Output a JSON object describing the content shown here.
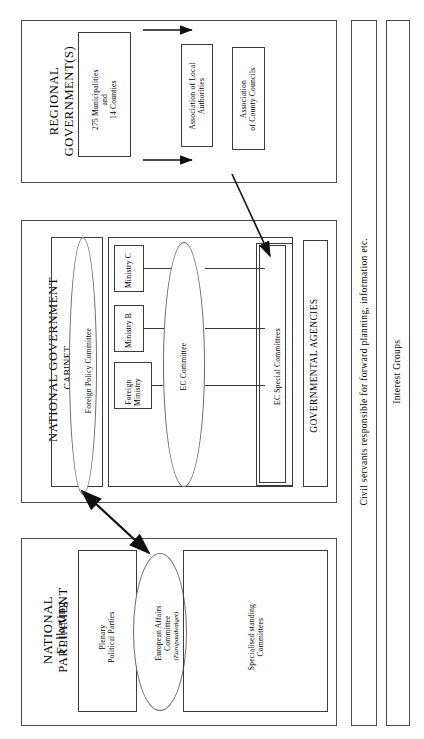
{
  "figure": {
    "orientation": "rotated-90-ccw",
    "panels": {
      "regional": {
        "title": "REGIONAL\nGOVERNMENT(S)",
        "boxes": {
          "municipalities": "275 Municipalities\nand\n14 Counties",
          "association_local": "Association of Local\nAuthorities",
          "association_county": "Association\nof County Councils"
        }
      },
      "national_government": {
        "title": "NATIONAL GOVERNMENT",
        "cabinet_label": "CABINET",
        "foreign_policy_committee": "Foreign Policy Committee",
        "ministries": [
          "Ministry C",
          "Ministry B",
          "Foreign\nMinistry"
        ],
        "ec_committee": "EC Committee",
        "ec_special_committees": "EC Special Committees",
        "governmental_agencies": "GOVERNMENTAL AGENCIES"
      },
      "national_parliament": {
        "title": "NATIONAL\nPARLIAMENT",
        "subtitle": "Folketing",
        "plenary": "Plenary\nPolitical Parties",
        "european_affairs_committee": "European Affairs\nCommittee",
        "european_affairs_committee_native": "(Europaudvalget)",
        "specialised_committees": "Specialised standing\nCommittees"
      },
      "civil_servants": {
        "label": "Civil servants responsible for forward planning, information etc."
      },
      "interest_groups": {
        "label": "Interest Groups"
      }
    },
    "colors": {
      "stroke": "#3a3a3a",
      "ellipse_stroke": "#6a6a6a",
      "background": "#ffffff",
      "text": "#000000"
    }
  }
}
